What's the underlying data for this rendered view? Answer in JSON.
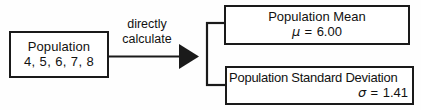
{
  "diagram": {
    "background_color": "#fefefe",
    "stroke_color": "#1a1a1a",
    "source_box": {
      "label": "Population",
      "values": "4, 5, 6, 7, 8"
    },
    "arrow": {
      "label_line1": "directly",
      "label_line2": "calculate",
      "direction": "left-to-right"
    },
    "results": [
      {
        "title": "Population Mean",
        "symbol": "μ",
        "equals": "=",
        "value": "6.00",
        "value_text": "μ = 6.00"
      },
      {
        "title": "Population Standard Deviation",
        "symbol": "σ",
        "equals": "=",
        "value": "1.41",
        "value_text": "σ = 1.41"
      }
    ]
  }
}
